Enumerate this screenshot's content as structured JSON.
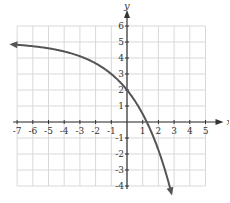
{
  "chart_data": {
    "type": "line",
    "title": "",
    "xlabel": "x",
    "ylabel": "y",
    "xlim": [
      -7,
      5
    ],
    "ylim": [
      -4,
      6
    ],
    "x_ticks": [
      -7,
      -6,
      -5,
      -4,
      -3,
      -2,
      -1,
      1,
      2,
      3,
      4,
      5
    ],
    "y_ticks": [
      -4,
      -3,
      -2,
      -1,
      1,
      2,
      3,
      4,
      5,
      6
    ],
    "grid": true,
    "series": [
      {
        "name": "f(x)",
        "function": "5 - 3*1.5^x",
        "x": [
          -7.3,
          -6,
          -5,
          -4,
          -3,
          -2,
          -1,
          0,
          0.5,
          1,
          1.26,
          1.5,
          2,
          2.5,
          2.85
        ],
        "values": [
          4.85,
          4.74,
          4.6,
          4.41,
          4.11,
          3.67,
          3.0,
          2.0,
          1.33,
          0.5,
          0.0,
          -0.51,
          -1.75,
          -3.2,
          -4.3
        ],
        "arrows": "both",
        "color": "#555555"
      }
    ],
    "y_intercept": 2,
    "x_intercept": 1.26,
    "asymptote_y": 5
  },
  "colors": {
    "grid": "#d9d9d9",
    "axis": "#333333",
    "curve": "#555555"
  }
}
